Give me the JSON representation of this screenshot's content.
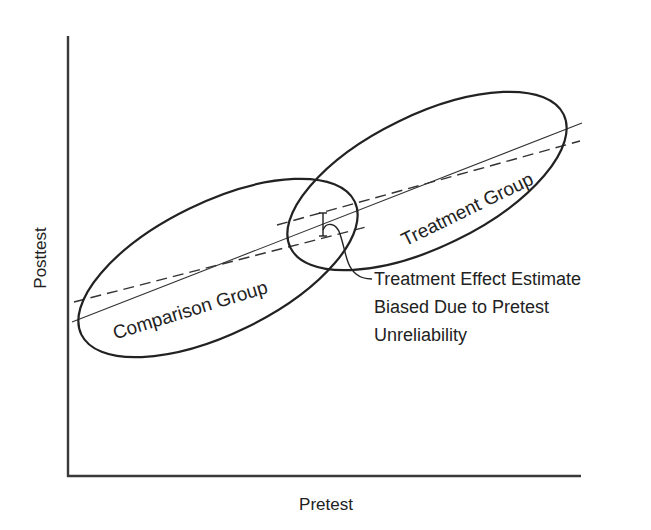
{
  "diagram": {
    "axes": {
      "x_label": "Pretest",
      "y_label": "Posttest"
    },
    "groups": [
      {
        "name": "comparison",
        "label": "Comparison Group"
      },
      {
        "name": "treatment",
        "label": "Treatment Group"
      }
    ],
    "annotation": {
      "lines": [
        "Treatment Effect Estimate",
        "Biased Due to Pretest",
        "Unreliability"
      ]
    },
    "lines": [
      {
        "name": "true-regression-line",
        "style": "solid"
      },
      {
        "name": "comparison-regression-line",
        "style": "dashed"
      },
      {
        "name": "treatment-regression-line",
        "style": "dashed"
      }
    ],
    "colors": {
      "background": "#ffffff",
      "stroke": "#222222"
    }
  }
}
